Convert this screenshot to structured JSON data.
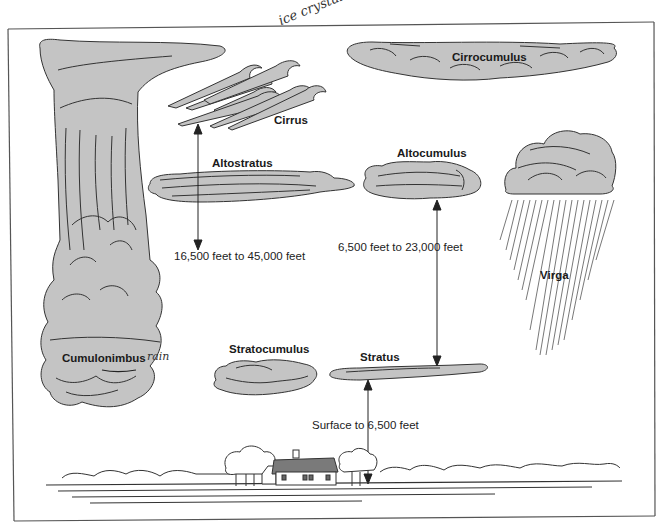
{
  "diagram": {
    "colors": {
      "cloud_fill": "#c4c4c4",
      "cloud_stroke": "#333333",
      "roof": "#7a7a7a",
      "frame": "#555555",
      "background": "#ffffff"
    },
    "clouds": [
      {
        "id": "cirrus",
        "label": "Cirrus"
      },
      {
        "id": "cirrocumulus",
        "label": "Cirrocumulus"
      },
      {
        "id": "altostratus",
        "label": "Altostratus"
      },
      {
        "id": "altocumulus",
        "label": "Altocumulus"
      },
      {
        "id": "virga",
        "label": "Virga"
      },
      {
        "id": "cumulonimbus",
        "label": "Cumulonimbus"
      },
      {
        "id": "stratocumulus",
        "label": "Stratocumulus"
      },
      {
        "id": "stratus",
        "label": "Stratus"
      }
    ],
    "altitude_ranges": [
      {
        "id": "high",
        "label": "16,500 feet to 45,000 feet"
      },
      {
        "id": "middle",
        "label": "6,500 feet to 23,000 feet"
      },
      {
        "id": "low",
        "label": "Surface to 6,500 feet"
      }
    ],
    "handwritten_notes": [
      {
        "id": "ice-crystals",
        "text": "ice crystals"
      },
      {
        "id": "rain",
        "text": "rain"
      }
    ]
  }
}
